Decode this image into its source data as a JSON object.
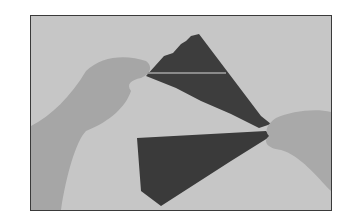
{
  "image": {
    "description": "Grayscale photo of two hands holding and pulling apart a folded dark paper fan against a light gray background",
    "colors": {
      "background": "#c4c4c4",
      "paper": "#3c3c3c",
      "skin": "#a8a8a8",
      "frame": "#3a3a3a"
    }
  }
}
